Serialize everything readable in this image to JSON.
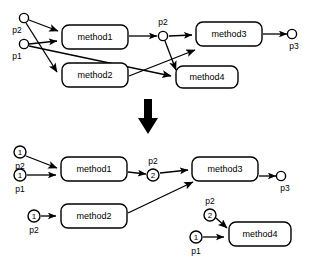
{
  "figure": {
    "stroke_color": "#000000",
    "fill_color": "#ffffff"
  },
  "transform_arrow": {
    "name": "downward-transformation-arrow",
    "direction": "down"
  },
  "top_graph": {
    "name": "before-graph",
    "nodes": [
      {
        "id": "t-method1",
        "label": "method1",
        "x": 62,
        "y": 25,
        "w": 66,
        "h": 24
      },
      {
        "id": "t-method2",
        "label": "method2",
        "x": 62,
        "y": 63,
        "w": 66,
        "h": 24
      },
      {
        "id": "t-method3",
        "label": "method3",
        "x": 196,
        "y": 22,
        "w": 66,
        "h": 24
      },
      {
        "id": "t-method4",
        "label": "method4",
        "x": 176,
        "y": 66,
        "w": 62,
        "h": 22
      }
    ],
    "ports": [
      {
        "id": "t-p2-in",
        "label": "p2",
        "count": "",
        "cx": 24,
        "cy": 18,
        "r": 4.6,
        "label_pos": "below"
      },
      {
        "id": "t-p1-in",
        "label": "p1",
        "count": "",
        "cx": 24,
        "cy": 44,
        "r": 4.6,
        "label_pos": "below"
      },
      {
        "id": "t-p2-mid",
        "label": "p2",
        "count": "",
        "cx": 163,
        "cy": 36,
        "r": 4.6,
        "label_pos": "above"
      },
      {
        "id": "t-p3-out",
        "label": "p3",
        "count": "",
        "cx": 292,
        "cy": 34,
        "r": 4.6,
        "label_pos": "below"
      }
    ]
  },
  "bottom_graph": {
    "name": "after-graph",
    "nodes": [
      {
        "id": "b-method1",
        "label": "method1",
        "x": 61,
        "y": 157,
        "w": 66,
        "h": 24
      },
      {
        "id": "b-method2",
        "label": "method2",
        "x": 61,
        "y": 204,
        "w": 66,
        "h": 24
      },
      {
        "id": "b-method3",
        "label": "method3",
        "x": 192,
        "y": 157,
        "w": 66,
        "h": 24
      },
      {
        "id": "b-method4",
        "label": "method4",
        "x": 229,
        "y": 222,
        "w": 62,
        "h": 24
      }
    ],
    "ports": [
      {
        "id": "b-p2-m1",
        "label": "p2",
        "count": "1",
        "cx": 20,
        "cy": 152,
        "r": 6.0,
        "label_pos": "below"
      },
      {
        "id": "b-p1-m1",
        "label": "p1",
        "count": "1",
        "cx": 20,
        "cy": 175,
        "r": 6.0,
        "label_pos": "below"
      },
      {
        "id": "b-p2-mid",
        "label": "p2",
        "count": "2",
        "cx": 153,
        "cy": 175,
        "r": 6.0,
        "label_pos": "above"
      },
      {
        "id": "b-p3-out",
        "label": "p3",
        "count": "",
        "cx": 281,
        "cy": 176,
        "r": 4.6,
        "label_pos": "below"
      },
      {
        "id": "b-p2-m2",
        "label": "p2",
        "count": "1",
        "cx": 34,
        "cy": 216,
        "r": 6.0,
        "label_pos": "below"
      },
      {
        "id": "b-p2-m4",
        "label": "p2",
        "count": "2",
        "cx": 210,
        "cy": 215,
        "r": 6.0,
        "label_pos": "above"
      },
      {
        "id": "b-p1-m4",
        "label": "p1",
        "count": "1",
        "cx": 196,
        "cy": 237,
        "r": 6.0,
        "label_pos": "below"
      }
    ]
  }
}
